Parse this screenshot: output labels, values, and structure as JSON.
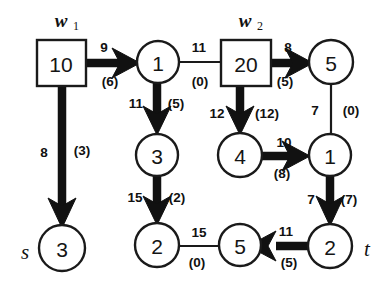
{
  "figure": {
    "background_color": "#ffffff",
    "stroke_color": "#111111"
  },
  "terminals": {
    "source_label": "s",
    "sink_label": "t"
  },
  "warehouse_labels": [
    {
      "name": "w1",
      "base": "w",
      "sub": "1"
    },
    {
      "name": "w2",
      "base": "w",
      "sub": "2"
    }
  ],
  "nodes": [
    {
      "id": "box-w1",
      "shape": "box",
      "label": "10",
      "cx": 61,
      "cy": 63
    },
    {
      "id": "circ-1a",
      "shape": "circle",
      "label": "1",
      "cx": 158,
      "cy": 62
    },
    {
      "id": "box-w2",
      "shape": "box",
      "label": "20",
      "cx": 245,
      "cy": 63
    },
    {
      "id": "circ-5a",
      "shape": "circle",
      "label": "5",
      "cx": 331,
      "cy": 62
    },
    {
      "id": "circ-3mid",
      "shape": "circle",
      "label": "3",
      "cx": 157,
      "cy": 155
    },
    {
      "id": "circ-4",
      "shape": "circle",
      "label": "4",
      "cx": 240,
      "cy": 155
    },
    {
      "id": "circ-1b",
      "shape": "circle",
      "label": "1",
      "cx": 330,
      "cy": 155
    },
    {
      "id": "circ-3s",
      "shape": "circle",
      "label": "3",
      "cx": 62,
      "cy": 248
    },
    {
      "id": "circ-2mid",
      "shape": "circle",
      "label": "2",
      "cx": 157,
      "cy": 245
    },
    {
      "id": "circ-5b",
      "shape": "circle",
      "label": "5",
      "cx": 240,
      "cy": 245
    },
    {
      "id": "circ-2t",
      "shape": "circle",
      "label": "2",
      "cx": 330,
      "cy": 246
    }
  ],
  "edges": [
    {
      "id": "e-w1-to-1",
      "from": "box-w1",
      "to": "circ-1a",
      "capacity": "9",
      "flow": "(6)",
      "style": "thick",
      "direction": "right"
    },
    {
      "id": "e-1-to-w2",
      "from": "circ-1a",
      "to": "box-w2",
      "capacity": "11",
      "flow": "(0)",
      "style": "thin",
      "direction": "right"
    },
    {
      "id": "e-w2-to-5",
      "from": "box-w2",
      "to": "circ-5a",
      "capacity": "8",
      "flow": "(5)",
      "style": "thick",
      "direction": "right"
    },
    {
      "id": "e-w1-to-3s",
      "from": "box-w1",
      "to": "circ-3s",
      "capacity": "8",
      "flow": "(3)",
      "style": "thick",
      "direction": "down"
    },
    {
      "id": "e-1-to-3",
      "from": "circ-1a",
      "to": "circ-3mid",
      "capacity": "11",
      "flow": "(5)",
      "style": "thick",
      "direction": "down"
    },
    {
      "id": "e-w2-to-4",
      "from": "box-w2",
      "to": "circ-4",
      "capacity": "12",
      "flow": "(12)",
      "style": "thick",
      "direction": "down"
    },
    {
      "id": "e-5-to-1",
      "from": "circ-5a",
      "to": "circ-1b",
      "capacity": "7",
      "flow": "(0)",
      "style": "thin",
      "direction": "down"
    },
    {
      "id": "e-4-to-1",
      "from": "circ-4",
      "to": "circ-1b",
      "capacity": "10",
      "flow": "(8)",
      "style": "thick",
      "direction": "right"
    },
    {
      "id": "e-3-to-2",
      "from": "circ-3mid",
      "to": "circ-2mid",
      "capacity": "15",
      "flow": "(2)",
      "style": "thick",
      "direction": "down"
    },
    {
      "id": "e-1-to-2t",
      "from": "circ-1b",
      "to": "circ-2t",
      "capacity": "7",
      "flow": "(7)",
      "style": "thick",
      "direction": "down"
    },
    {
      "id": "e-2-to-5",
      "from": "circ-2mid",
      "to": "circ-5b",
      "capacity": "15",
      "flow": "(0)",
      "style": "thin",
      "direction": "right"
    },
    {
      "id": "e-2t-to-5",
      "from": "circ-2t",
      "to": "circ-5b",
      "capacity": "11",
      "flow": "(5)",
      "style": "thick",
      "direction": "left"
    }
  ],
  "edge_label_positions": [
    {
      "id": "lbl-e-w1-to-1-cap",
      "text": "9",
      "x": 104,
      "y": 47
    },
    {
      "id": "lbl-e-w1-to-1-flow",
      "text": "(6)",
      "x": 110,
      "y": 81
    },
    {
      "id": "lbl-e-1-to-w2-cap",
      "text": "11",
      "x": 199,
      "y": 47
    },
    {
      "id": "lbl-e-1-to-w2-flow",
      "text": "(0)",
      "x": 200,
      "y": 81
    },
    {
      "id": "lbl-e-w2-to-5-cap",
      "text": "8",
      "x": 288,
      "y": 47
    },
    {
      "id": "lbl-e-w2-to-5-flow",
      "text": "(5)",
      "x": 285,
      "y": 81
    },
    {
      "id": "lbl-e-w1-to-3s-cap",
      "text": "8",
      "x": 44,
      "y": 152
    },
    {
      "id": "lbl-e-w1-to-3s-flow",
      "text": "(3)",
      "x": 82,
      "y": 150
    },
    {
      "id": "lbl-e-1-to-3-cap",
      "text": "11",
      "x": 136,
      "y": 103
    },
    {
      "id": "lbl-e-1-to-3-flow",
      "text": "(5)",
      "x": 174,
      "y": 103
    },
    {
      "id": "lbl-e-w2-to-4-cap",
      "text": "12",
      "x": 217,
      "y": 113
    },
    {
      "id": "lbl-e-w2-to-4-flow",
      "text": "(12)",
      "x": 265,
      "y": 113
    },
    {
      "id": "lbl-e-5-to-1-cap",
      "text": "7",
      "x": 315,
      "y": 110
    },
    {
      "id": "lbl-e-5-to-1-flow",
      "text": "(0)",
      "x": 351,
      "y": 110
    },
    {
      "id": "lbl-e-4-to-1-cap",
      "text": "10",
      "x": 284,
      "y": 142
    },
    {
      "id": "lbl-e-4-to-1-flow",
      "text": "(8)",
      "x": 282,
      "y": 173
    },
    {
      "id": "lbl-e-3-to-2-cap",
      "text": "15",
      "x": 135,
      "y": 197
    },
    {
      "id": "lbl-e-3-to-2-flow",
      "text": "(2)",
      "x": 175,
      "y": 197
    },
    {
      "id": "lbl-e-1-to-2t-cap",
      "text": "7",
      "x": 311,
      "y": 199
    },
    {
      "id": "lbl-e-1-to-2t-flow",
      "text": "(7)",
      "x": 348,
      "y": 199
    },
    {
      "id": "lbl-e-2-to-5-cap",
      "text": "15",
      "x": 199,
      "y": 232
    },
    {
      "id": "lbl-e-2-to-5-flow",
      "text": "(0)",
      "x": 197,
      "y": 262
    },
    {
      "id": "lbl-e-2t-to-5-cap",
      "text": "11",
      "x": 286,
      "y": 231
    },
    {
      "id": "lbl-e-2t-to-5-flow",
      "text": "(5)",
      "x": 289,
      "y": 262
    }
  ]
}
